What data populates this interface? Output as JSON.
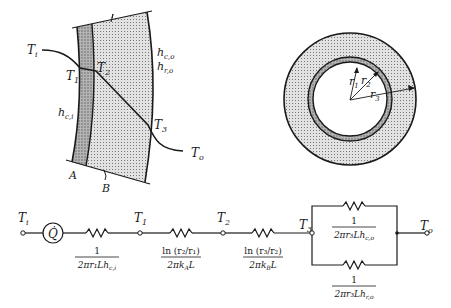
{
  "colors": {
    "ink": "#1a1a1a",
    "layer_a": "#a8a8a8",
    "layer_b": "#d6d6d6",
    "background": "#ffffff"
  },
  "wall_diagram": {
    "T_i": "T",
    "T_i_sub": "i",
    "T_1": "T",
    "T_1_sub": "1",
    "T_2": "T",
    "T_2_sub": "2",
    "T_3": "T",
    "T_3_sub": "3",
    "T_o": "T",
    "T_o_sub": "o",
    "h_ci": "h",
    "h_ci_sub": "c,i",
    "h_co": "h",
    "h_co_sub": "c,o",
    "h_ro": "h",
    "h_ro_sub": "r,o",
    "layer_a_label": "A",
    "layer_b_label": "B"
  },
  "cross_section": {
    "r1": "r",
    "r1_sub": "1",
    "r2": "r",
    "r2_sub": "2",
    "r3": "r",
    "r3_sub": "3"
  },
  "circuit": {
    "node_Ti": "T",
    "node_Ti_sub": "i",
    "source": "Q̇",
    "node_T1": "T",
    "node_T1_sub": "1",
    "node_T2": "T",
    "node_T2_sub": "2",
    "node_T3": "T",
    "node_T3_sub": "3",
    "node_To": "T",
    "node_To_sub": "o",
    "R1": {
      "num": "1",
      "den": "2πr₁Lh",
      "den_sub": "c,i"
    },
    "R2": {
      "num": "ln (r₂/r₁)",
      "den": "2πk",
      "den_sub": "A",
      "den_tail": "L"
    },
    "R3": {
      "num": "ln (r₃/r₂)",
      "den": "2πk",
      "den_sub": "B",
      "den_tail": "L"
    },
    "R4": {
      "num": "1",
      "den": "2πr₃Lh",
      "den_sub": "c,o"
    },
    "R5": {
      "num": "1",
      "den": "2πr₃Lh",
      "den_sub": "r,o"
    }
  }
}
